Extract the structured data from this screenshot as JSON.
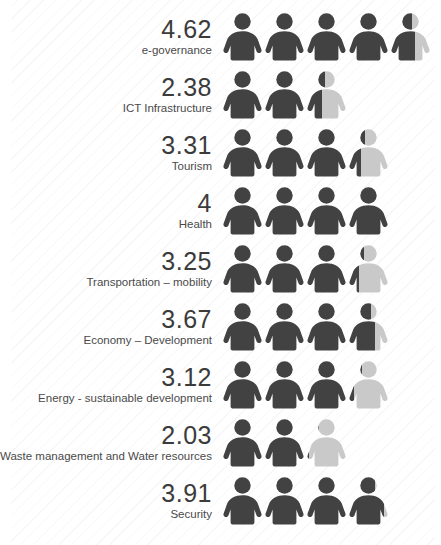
{
  "colors": {
    "filled": "#424242",
    "empty": "#c9c9c9",
    "value_text": "#3b3b3b",
    "caption_text": "#4a4a4a",
    "background": "#ffffff",
    "stripe": "#f2f2f2"
  },
  "chart_data": {
    "type": "bar",
    "subtype": "pictogram",
    "title": "",
    "xlabel": "",
    "ylabel": "",
    "xlim": [
      0,
      5
    ],
    "icon_unit": 1,
    "icon_name": "person-icon",
    "grid": false,
    "legend": null,
    "categories": [
      "e-governance",
      "ICT Infrastructure",
      "Tourism",
      "Health",
      "Transportation – mobility",
      "Economy – Development",
      "Energy - sustainable development",
      "Waste management and Water resources",
      "Security"
    ],
    "values": [
      4.62,
      2.38,
      3.31,
      4,
      3.25,
      3.67,
      3.12,
      2.03,
      3.91
    ],
    "value_labels": [
      "4.62",
      "2.38",
      "3.31",
      "4",
      "3.25",
      "3.67",
      "3.12",
      "2.03",
      "3.91"
    ]
  },
  "rows": [
    {
      "value": "4.62",
      "caption": "e-governance",
      "icons": [
        {
          "fill": 1
        },
        {
          "fill": 1
        },
        {
          "fill": 1
        },
        {
          "fill": 1
        },
        {
          "fill": 0.62
        }
      ]
    },
    {
      "value": "2.38",
      "caption": "ICT Infrastructure",
      "icons": [
        {
          "fill": 1
        },
        {
          "fill": 1
        },
        {
          "fill": 0.38
        }
      ]
    },
    {
      "value": "3.31",
      "caption": "Tourism",
      "icons": [
        {
          "fill": 1
        },
        {
          "fill": 1
        },
        {
          "fill": 1
        },
        {
          "fill": 0.31
        }
      ]
    },
    {
      "value": "4",
      "caption": "Health",
      "icons": [
        {
          "fill": 1
        },
        {
          "fill": 1
        },
        {
          "fill": 1
        },
        {
          "fill": 1
        }
      ]
    },
    {
      "value": "3.25",
      "caption": "Transportation – mobility",
      "icons": [
        {
          "fill": 1
        },
        {
          "fill": 1
        },
        {
          "fill": 1
        },
        {
          "fill": 0.25
        }
      ]
    },
    {
      "value": "3.67",
      "caption": "Economy – Development",
      "icons": [
        {
          "fill": 1
        },
        {
          "fill": 1
        },
        {
          "fill": 1
        },
        {
          "fill": 0.67
        }
      ]
    },
    {
      "value": "3.12",
      "caption": "Energy - sustainable development",
      "icons": [
        {
          "fill": 1
        },
        {
          "fill": 1
        },
        {
          "fill": 1
        },
        {
          "fill": 0.12
        }
      ]
    },
    {
      "value": "2.03",
      "caption": "Waste management and Water resources",
      "icons": [
        {
          "fill": 1
        },
        {
          "fill": 1
        },
        {
          "fill": 0.03
        }
      ]
    },
    {
      "value": "3.91",
      "caption": "Security",
      "icons": [
        {
          "fill": 1
        },
        {
          "fill": 1
        },
        {
          "fill": 1
        },
        {
          "fill": 0.91
        }
      ]
    }
  ]
}
